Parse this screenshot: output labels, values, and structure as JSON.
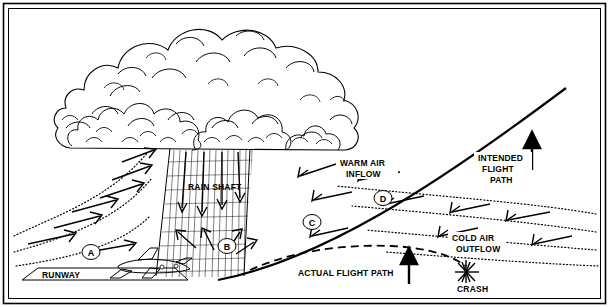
{
  "diagram": {
    "frame": {
      "border_color": "#000000",
      "background": "#ffffff"
    },
    "labels": {
      "runway": "RUNWAY",
      "rain_shaft": "RAIN SHAFT",
      "warm_air_inflow": "WARM AIR\nINFLOW",
      "warm_air_inflow_line1": "WARM AIR",
      "warm_air_inflow_line2": "INFLOW",
      "intended_flight_path_line1": "INTENDED",
      "intended_flight_path_line2": "FLIGHT",
      "intended_flight_path_line3": "PATH",
      "cold_air_outflow_line1": "COLD AIR",
      "cold_air_outflow_line2": "OUTFLOW",
      "actual_flight_path": "ACTUAL FLIGHT PATH",
      "crash": "CRASH"
    },
    "markers": [
      {
        "id": "A",
        "label": "A"
      },
      {
        "id": "B",
        "label": "B"
      },
      {
        "id": "C",
        "label": "C"
      },
      {
        "id": "D",
        "label": "D"
      }
    ],
    "elements": {
      "cloud": "cumulonimbus-cloud",
      "rain_shaft": "rain-shaft-hatched",
      "aircraft": "airplane-silhouette",
      "crash_star": "crash-burst-star",
      "runway_strip": "runway-strip"
    },
    "colors": {
      "line": "#000000",
      "background": "#ffffff"
    }
  }
}
